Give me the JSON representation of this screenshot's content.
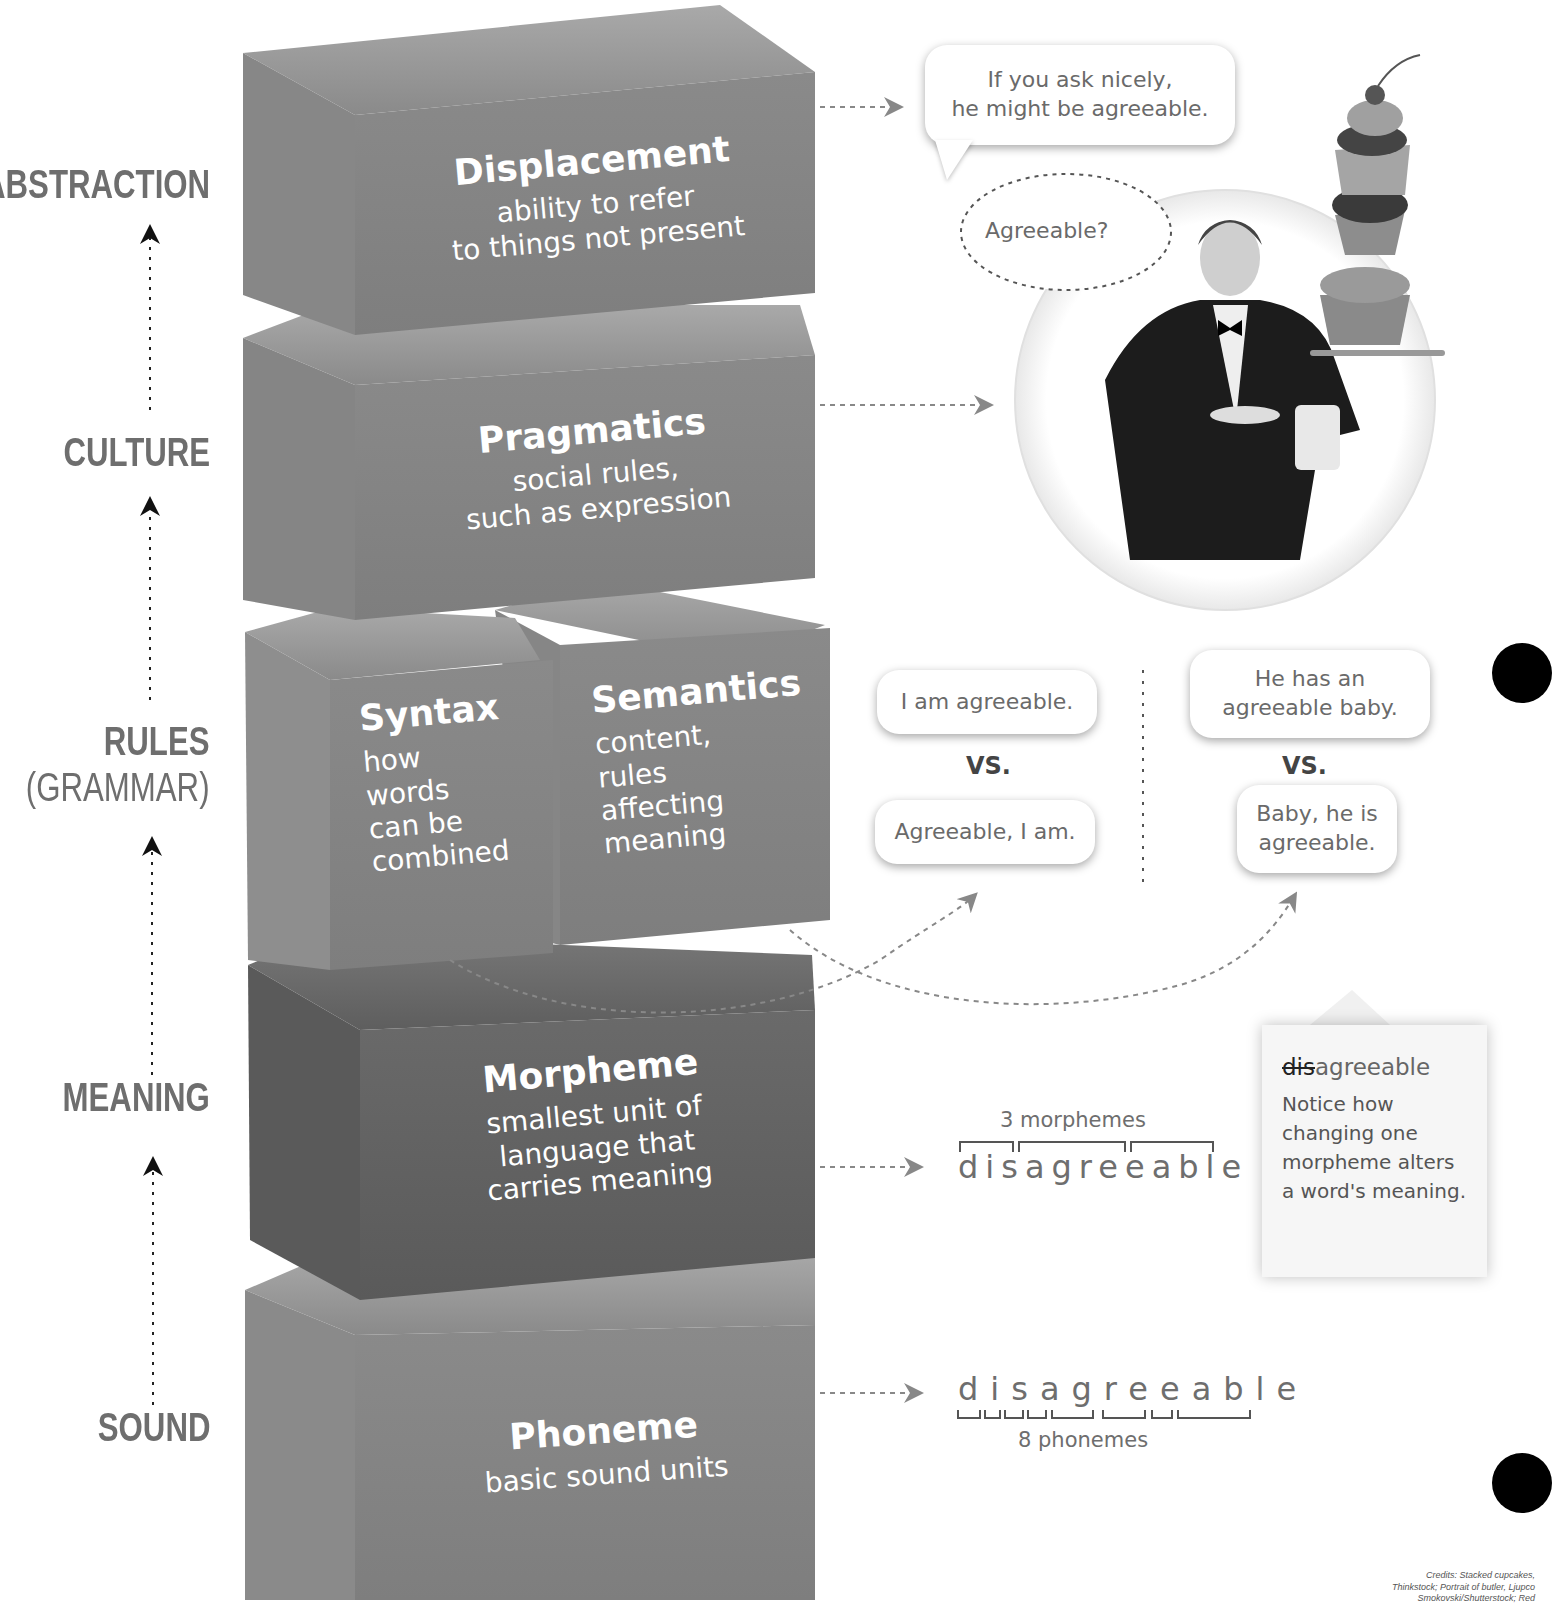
{
  "levels": [
    {
      "label": "ABSTRACTION",
      "sub": ""
    },
    {
      "label": "CULTURE",
      "sub": ""
    },
    {
      "label": "RULES",
      "sub": "(GRAMMAR)"
    },
    {
      "label": "MEANING",
      "sub": ""
    },
    {
      "label": "SOUND",
      "sub": ""
    }
  ],
  "blocks": {
    "displacement": {
      "title": "Displacement",
      "desc": "ability to refer\nto things not present"
    },
    "pragmatics": {
      "title": "Pragmatics",
      "desc": "social rules,\nsuch as expression"
    },
    "syntax": {
      "title": "Syntax",
      "desc": "how\nwords\ncan be\ncombined"
    },
    "semantics": {
      "title": "Semantics",
      "desc": "content,\nrules\naffecting\nmeaning"
    },
    "morpheme": {
      "title": "Morpheme",
      "desc": "smallest unit of\nlanguage that\ncarries meaning"
    },
    "phoneme": {
      "title": "Phoneme",
      "desc": "basic sound units"
    }
  },
  "bubbles": {
    "displacement_example": "If you ask nicely,\nhe might be agreeable.",
    "butler_thought": "Agreeable?",
    "syntax_a": "I am agreeable.",
    "syntax_vs": "VS.",
    "syntax_b": "Agreeable, I am.",
    "semantics_a": "He has an\nagreeable baby.",
    "semantics_vs": "VS.",
    "semantics_b": "Baby, he is\nagreeable."
  },
  "morpheme_example": {
    "caption": "3 morphemes",
    "word": "disagreeable",
    "segments": [
      "dis",
      "agree",
      "able"
    ]
  },
  "phoneme_example": {
    "caption": "8 phonemes",
    "word": "disagreeable",
    "segments": [
      "d",
      "i",
      "s",
      "a",
      "gr",
      "ee",
      "a",
      "ble"
    ]
  },
  "note": {
    "struck": "dis",
    "rest": "agreeable",
    "text": "Notice how changing one morpheme alters a word's meaning."
  },
  "credits": "Credits: Stacked cupcakes, Thinkstock; Portrait of butler, Ljupco Smokovski/Shutterstock; Red",
  "colors": {
    "block_light": "#8c8c8c",
    "block_mid": "#7a7a7a",
    "block_dark": "#5e5e5e",
    "label_gray": "#6e6e6e"
  }
}
